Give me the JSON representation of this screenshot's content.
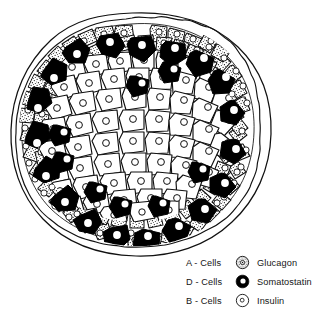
{
  "figure": {
    "background_color": "#ffffff",
    "ink_color": "#000000"
  },
  "islet": {
    "capsule": {
      "name": "connective-tissue-capsule",
      "line_style": "double wavy outline",
      "stroke_color": "#000000"
    },
    "cell_types": [
      {
        "key": "a_cell",
        "code": "A",
        "fill": "stippled",
        "region": "periphery",
        "approx_count": 86
      },
      {
        "key": "d_cell",
        "code": "D",
        "fill": "solid-black",
        "region": "periphery-ring",
        "approx_count": 24
      },
      {
        "key": "b_cell",
        "code": "B",
        "fill": "white",
        "region": "core",
        "approx_count": 150
      }
    ]
  },
  "legend": {
    "name": "cell-type-legend",
    "rows": [
      {
        "cell_label": "A - Cells",
        "swatch": "stippled-cell-icon",
        "hormone": "Glucagon"
      },
      {
        "cell_label": "D - Cells",
        "swatch": "black-cell-icon",
        "hormone": "Somatostatin"
      },
      {
        "cell_label": "B - Cells",
        "swatch": "open-cell-icon",
        "hormone": "Insulin"
      }
    ]
  }
}
